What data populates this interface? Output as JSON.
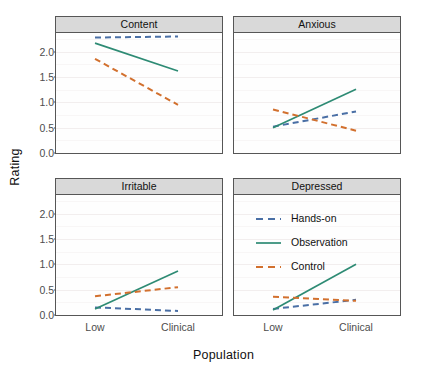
{
  "chart_data": {
    "type": "line",
    "title": "",
    "xlabel": "Population",
    "ylabel": "Rating",
    "categories": [
      "Low",
      "Clinical"
    ],
    "x": [
      0,
      1
    ],
    "ylim": [
      0,
      2.35
    ],
    "yticks": [
      0.0,
      0.5,
      1.0,
      1.5,
      2.0
    ],
    "ytick_labels": [
      "0.0",
      "0.5",
      "1.0",
      "1.5",
      "2.0"
    ],
    "grid": true,
    "legend_position": "inside-bottom-right-panel",
    "facet_variable": "Outcome",
    "facets": [
      {
        "name": "Content",
        "series": [
          {
            "name": "Hands-on",
            "values": [
              2.28,
              2.3
            ]
          },
          {
            "name": "Observation",
            "values": [
              2.17,
              1.62
            ]
          },
          {
            "name": "Control",
            "values": [
              1.86,
              0.95
            ]
          }
        ]
      },
      {
        "name": "Anxious",
        "series": [
          {
            "name": "Hands-on",
            "values": [
              0.52,
              0.82
            ]
          },
          {
            "name": "Observation",
            "values": [
              0.5,
              1.26
            ]
          },
          {
            "name": "Control",
            "values": [
              0.86,
              0.44
            ]
          }
        ]
      },
      {
        "name": "Irritable",
        "series": [
          {
            "name": "Hands-on",
            "values": [
              0.15,
              0.08
            ]
          },
          {
            "name": "Observation",
            "values": [
              0.12,
              0.87
            ]
          },
          {
            "name": "Control",
            "values": [
              0.37,
              0.55
            ]
          }
        ]
      },
      {
        "name": "Depressed",
        "series": [
          {
            "name": "Hands-on",
            "values": [
              0.12,
              0.3
            ]
          },
          {
            "name": "Observation",
            "values": [
              0.1,
              1.0
            ]
          },
          {
            "name": "Control",
            "values": [
              0.36,
              0.28
            ]
          }
        ]
      }
    ],
    "legend": [
      {
        "label": "Hands-on",
        "color": "#4a6fa5",
        "style": "dashed"
      },
      {
        "label": "Observation",
        "color": "#2e8b74",
        "style": "solid"
      },
      {
        "label": "Control",
        "color": "#d2702e",
        "style": "dashed"
      }
    ],
    "colors": {
      "hands_on": "#4a6fa5",
      "observation": "#2e8b74",
      "control": "#d2702e",
      "strip_background": "#d9d9d9",
      "panel_border": "#565656",
      "panel_background": "#fefefe",
      "grid": "#f2eeee",
      "text": "#111111",
      "tick_text": "#4d4d4d"
    }
  }
}
